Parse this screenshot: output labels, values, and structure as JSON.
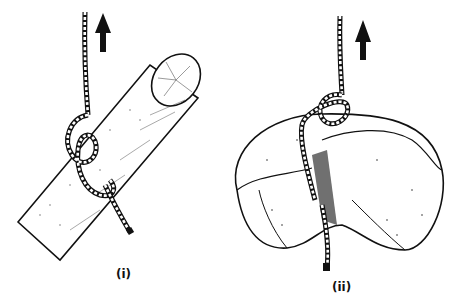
{
  "figures": [
    {
      "id": "i",
      "caption": "(i)",
      "subject": "rope knot tied around a log",
      "arrow": "up-arrow"
    },
    {
      "id": "ii",
      "caption": "(ii)",
      "subject": "rope knot tied around a bundled sack",
      "arrow": "up-arrow"
    }
  ],
  "colors": {
    "ink": "#111111",
    "paper": "#ffffff"
  }
}
